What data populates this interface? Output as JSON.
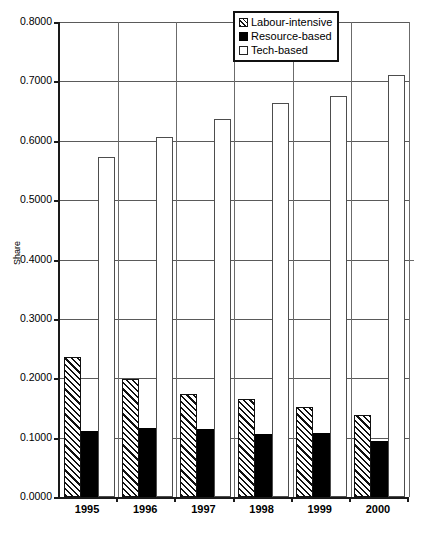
{
  "chart_data": {
    "type": "bar",
    "title": "",
    "xlabel": "",
    "ylabel": "Share",
    "ylim": [
      0.0,
      0.8
    ],
    "ytick_labels": [
      "0.8000",
      "0.7000",
      "0.6000",
      "0.5000",
      "0.4000",
      "0.3000",
      "0.2000",
      "0.1000",
      "0.0000"
    ],
    "ytick_values": [
      0.8,
      0.7,
      0.6,
      0.5,
      0.4,
      0.3,
      0.2,
      0.1,
      0.0
    ],
    "grid": true,
    "legend_position": "top-right",
    "categories": [
      "1995",
      "1996",
      "1997",
      "1998",
      "1999",
      "2000"
    ],
    "series": [
      {
        "name": "Labour-intensive",
        "style": "hatched",
        "values": [
          0.235,
          0.199,
          0.174,
          0.165,
          0.151,
          0.138
        ]
      },
      {
        "name": "Resource-based",
        "style": "solid-black",
        "values": [
          0.111,
          0.117,
          0.114,
          0.106,
          0.107,
          0.095
        ]
      },
      {
        "name": "Tech-based",
        "style": "open-white",
        "values": [
          0.572,
          0.606,
          0.636,
          0.664,
          0.675,
          0.711
        ]
      }
    ]
  },
  "legend": {
    "items": [
      {
        "label": "Labour-intensive",
        "swatch": "hatched-square-icon"
      },
      {
        "label": "Resource-based",
        "swatch": "filled-square-icon"
      },
      {
        "label": "Tech-based",
        "swatch": "empty-square-icon"
      }
    ]
  },
  "colors": {
    "axis": "#1a1a1a",
    "gridline": "#5a5a5a",
    "series_labour_intensive": "#111111",
    "series_resource_based": "#000000",
    "series_tech_based": "#ffffff",
    "background": "#ffffff"
  }
}
